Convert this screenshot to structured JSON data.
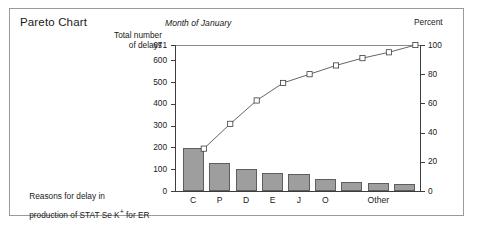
{
  "figure": {
    "title": "Pareto Chart",
    "subtitle": "Month of January",
    "left_axis_label": "Total number\nof delays",
    "right_axis_label": "Percent",
    "caption_line1": "Reasons for delay in",
    "caption_line2_prefix": "production of STAT Se K",
    "caption_superscript": "+",
    "caption_line2_suffix": " for ER",
    "border_color": "#9a9a9a",
    "bar_fill": "#9e9e9e",
    "bar_stroke": "#5e5e5e",
    "line_color": "#3d3d3d",
    "marker_fill": "#ffffff"
  },
  "chart_data": {
    "type": "bar",
    "title": "Pareto Chart",
    "subtitle": "Month of January",
    "xlabel": "Reasons for delay in production of STAT Se K+ for ER",
    "ylabel": "Total number of delays",
    "y2label": "Percent",
    "ylim": [
      0,
      671
    ],
    "y2lim": [
      0,
      100
    ],
    "grid": false,
    "legend": "none",
    "categories": [
      "C",
      "P",
      "D",
      "E",
      "J",
      "O",
      "",
      "Other",
      ""
    ],
    "visible_tick_labels": [
      "C",
      "P",
      "D",
      "E",
      "J",
      "O",
      "Other"
    ],
    "values": [
      198,
      127,
      102,
      83,
      80,
      57,
      42,
      35,
      30
    ],
    "cumulative_percent": [
      29.5,
      48.4,
      63.6,
      76.0,
      87.9,
      96.4,
      102.7,
      107.9,
      112.3
    ],
    "cumulative_percent_plotted": [
      29,
      46,
      62,
      74,
      80,
      86,
      91,
      95,
      100
    ],
    "yticks": [
      0,
      100,
      200,
      300,
      400,
      500,
      600,
      671
    ],
    "ytick_labels": [
      "0",
      "100",
      "200",
      "300",
      "400",
      "500",
      "600",
      "671"
    ],
    "y2ticks": [
      0,
      20,
      40,
      60,
      80,
      100
    ],
    "y2tick_labels": [
      "0",
      "20",
      "40",
      "60",
      "80",
      "100"
    ],
    "series": [
      {
        "name": "Number of delays",
        "type": "bar",
        "values": [
          198,
          127,
          102,
          83,
          80,
          57,
          42,
          35,
          30
        ]
      },
      {
        "name": "Cumulative percent",
        "type": "line",
        "marker": "square",
        "values": [
          29,
          46,
          62,
          74,
          80,
          86,
          91,
          95,
          100
        ]
      }
    ],
    "total": 671
  }
}
